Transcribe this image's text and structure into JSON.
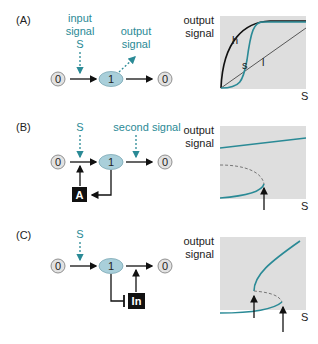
{
  "colors": {
    "teal": "#2a8a96",
    "node_fill": "#a9cfda",
    "zero_fill": "#e2e2e2",
    "plot_bg": "#dedede",
    "black": "#111111"
  },
  "panels": [
    {
      "label": "(A)",
      "input_signal": [
        "input",
        "signal",
        "S"
      ],
      "output_signal": [
        "output",
        "signal"
      ],
      "nodes": {
        "left": "0",
        "center": "1",
        "right": "0"
      },
      "plot": {
        "ylabel": [
          "output",
          "signal"
        ],
        "xlabel": "S",
        "curves": [
          {
            "name": "h",
            "label": "h",
            "type": "hyperbolic",
            "color": "black"
          },
          {
            "name": "s",
            "label": "s",
            "type": "sigmoidal",
            "color": "teal"
          },
          {
            "name": "l",
            "label": "l",
            "type": "linear",
            "color": "black"
          }
        ]
      }
    },
    {
      "label": "(B)",
      "input_signal": [
        "S"
      ],
      "second_signal": "second signal",
      "nodes": {
        "left": "0",
        "center": "1",
        "right": "0"
      },
      "feedback_box": "A",
      "plot": {
        "ylabel": [
          "output",
          "signal"
        ],
        "xlabel": "S",
        "description": "upper stable branch, lower stable branch with dashed unstable branch folding back; single threshold arrow"
      }
    },
    {
      "label": "(C)",
      "input_signal": [
        "S"
      ],
      "nodes": {
        "left": "0",
        "center": "1",
        "right": "0"
      },
      "inhibitor_box": "In",
      "plot": {
        "ylabel": [
          "output",
          "signal"
        ],
        "xlabel": "S",
        "description": "S-shaped bistable curve with dashed unstable middle branch; two threshold arrows"
      }
    }
  ]
}
